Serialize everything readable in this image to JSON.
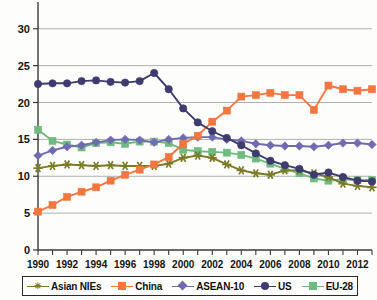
{
  "chart_data": {
    "type": "line",
    "title": "",
    "subtitle": "",
    "xlabel": "",
    "ylabel": "",
    "xlim": [
      1990,
      2013
    ],
    "ylim": [
      0,
      32
    ],
    "yticks": [
      0,
      5,
      10,
      15,
      20,
      25,
      30
    ],
    "ytick_labels": [
      "0",
      "5",
      "10",
      "15",
      "20",
      "25",
      "30"
    ],
    "x": [
      1990,
      1991,
      1992,
      1993,
      1994,
      1995,
      1996,
      1997,
      1998,
      1999,
      2000,
      2001,
      2002,
      2003,
      2004,
      2005,
      2006,
      2007,
      2008,
      2009,
      2010,
      2011,
      2012,
      2013
    ],
    "xtick_labels": [
      "1990",
      "",
      "1992",
      "",
      "1994",
      "",
      "1996",
      "",
      "1998",
      "",
      "2000",
      "",
      "2002",
      "",
      "2004",
      "",
      "2006",
      "",
      "2008",
      "",
      "2010",
      "",
      "2012",
      ""
    ],
    "grid": true,
    "grid_axis": "y",
    "legend_position": "bottom",
    "series": [
      {
        "name": "Asian NIEs",
        "color": "#7a7a27",
        "marker": "star",
        "values": [
          11.1,
          11.4,
          11.6,
          11.5,
          11.4,
          11.5,
          11.4,
          11.4,
          11.4,
          11.7,
          12.5,
          12.8,
          12.5,
          11.6,
          10.8,
          10.4,
          10.2,
          10.8,
          10.8,
          10.4,
          9.9,
          9.0,
          8.7,
          8.5
        ]
      },
      {
        "name": "China",
        "color": "#f2773f",
        "marker": "square",
        "values": [
          5.2,
          6.1,
          7.2,
          7.9,
          8.5,
          9.4,
          10.2,
          10.9,
          11.6,
          12.6,
          14.4,
          15.5,
          17.4,
          18.9,
          20.8,
          21.0,
          21.3,
          21.0,
          21.0,
          19.0,
          22.3,
          21.8,
          21.6,
          21.8
        ]
      },
      {
        "name": "ASEAN-10",
        "color": "#6f6bb0",
        "marker": "diamond",
        "values": [
          12.8,
          13.5,
          14.0,
          14.2,
          14.6,
          14.9,
          15.0,
          14.9,
          14.6,
          15.0,
          15.2,
          15.3,
          15.3,
          15.0,
          14.8,
          14.4,
          14.2,
          14.1,
          14.1,
          14.0,
          14.2,
          14.5,
          14.5,
          14.3
        ]
      },
      {
        "name": "US",
        "color": "#3e3c6e",
        "marker": "circle",
        "values": [
          22.5,
          22.6,
          22.6,
          22.9,
          23.0,
          22.8,
          22.7,
          22.9,
          24.0,
          21.8,
          19.2,
          17.3,
          16.1,
          15.2,
          14.2,
          13.1,
          12.1,
          11.5,
          11.0,
          10.2,
          10.5,
          9.9,
          9.4,
          9.3
        ]
      },
      {
        "name": "EU-28",
        "color": "#6fba7f",
        "marker": "square",
        "values": [
          16.3,
          14.8,
          14.3,
          13.9,
          14.5,
          14.6,
          14.4,
          14.7,
          14.7,
          14.5,
          13.6,
          13.4,
          13.3,
          13.2,
          12.9,
          12.4,
          11.7,
          11.0,
          10.4,
          9.7,
          9.4,
          9.6,
          9.5,
          9.5
        ]
      }
    ]
  },
  "legend": {
    "items": [
      {
        "label": "Asian NIEs",
        "color": "#7a7a27",
        "marker": "star"
      },
      {
        "label": "China",
        "color": "#f2773f",
        "marker": "square"
      },
      {
        "label": "ASEAN-10",
        "color": "#6f6bb0",
        "marker": "diamond"
      },
      {
        "label": "US",
        "color": "#3e3c6e",
        "marker": "circle"
      },
      {
        "label": "EU-28",
        "color": "#6fba7f",
        "marker": "square"
      }
    ]
  }
}
